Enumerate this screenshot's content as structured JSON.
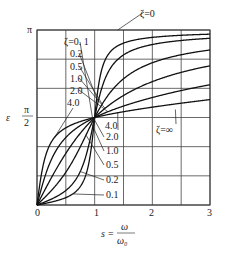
{
  "chart_data": {
    "type": "line",
    "title": "",
    "xlabel": "s = ω/ω₀",
    "ylabel": "ε",
    "x_label_parts": {
      "lhs": "s",
      "eq": "=",
      "num": "ω",
      "den": "ω₀"
    },
    "y_label_symbol": "ε",
    "xlim": [
      0,
      3
    ],
    "ylim_rad": [
      0,
      3.14159
    ],
    "x_ticks": [
      {
        "value": 0,
        "label": "0"
      },
      {
        "value": 1,
        "label": "1"
      },
      {
        "value": 2,
        "label": "2"
      },
      {
        "value": 3,
        "label": "3"
      }
    ],
    "y_ticks": [
      {
        "value": 0,
        "label": ""
      },
      {
        "value": 1.5708,
        "label_num": "π",
        "label_den": "2"
      },
      {
        "value": 3.14159,
        "label": "π"
      }
    ],
    "grid": {
      "x_step": 0.5,
      "y_divisions": 6
    },
    "formula": "ε(s) = atan2(2ζs, 1 − s²)",
    "series": [
      {
        "name": "ζ=0.1",
        "zeta": 0.1
      },
      {
        "name": "ζ=0.2",
        "zeta": 0.2
      },
      {
        "name": "ζ=0.5",
        "zeta": 0.5
      },
      {
        "name": "ζ=1.0",
        "zeta": 1.0
      },
      {
        "name": "ζ=2.0",
        "zeta": 2.0
      },
      {
        "name": "ζ=4.0",
        "zeta": 4.0
      }
    ],
    "sample_values": {
      "s": [
        0,
        0.5,
        1,
        1.5,
        2,
        3
      ],
      "zeta_0.1": [
        0,
        0.133,
        1.571,
        3.021,
        3.075,
        3.116
      ],
      "zeta_0.2": [
        0,
        0.261,
        1.571,
        2.9,
        3.008,
        3.092
      ],
      "zeta_0.5": [
        0,
        0.588,
        1.571,
        2.265,
        2.554,
        2.782
      ],
      "zeta_1.0": [
        0,
        0.927,
        1.571,
        2.176,
        2.214,
        2.498
      ],
      "zeta_2.0": [
        0,
        1.212,
        1.571,
        1.966,
        2.214,
        2.159
      ],
      "zeta_4.0": [
        0,
        1.385,
        1.571,
        1.765,
        2.025,
        1.875
      ]
    },
    "annotations": {
      "upper": [
        {
          "text": "ζ=0. 1",
          "series": "ζ=0.1"
        },
        {
          "text": "0.2",
          "series": "ζ=0.2"
        },
        {
          "text": "0.5",
          "series": "ζ=0.5"
        },
        {
          "text": "1.0",
          "series": "ζ=1.0"
        },
        {
          "text": "2.0",
          "series": "ζ=2.0"
        },
        {
          "text": "4.0",
          "series": "ζ=4.0"
        }
      ],
      "lower": [
        {
          "text": "4.0",
          "series": "ζ=4.0"
        },
        {
          "text": "2.0",
          "series": "ζ=2.0"
        },
        {
          "text": "1.0",
          "series": "ζ=1.0"
        },
        {
          "text": "0.5",
          "series": "ζ=0.5"
        },
        {
          "text": "0.2",
          "series": "ζ=0.2"
        },
        {
          "text": "0.1",
          "series": "ζ=0.1"
        }
      ],
      "zeta_zero": "ζ=0",
      "zeta_inf": "ζ=∞",
      "right_4": "4.0"
    },
    "legend": "none (inline labels)"
  }
}
